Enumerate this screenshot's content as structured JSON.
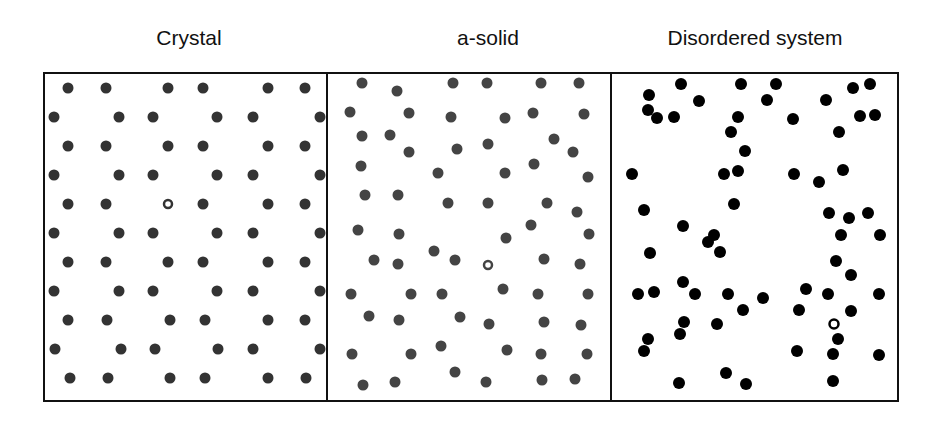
{
  "panels": [
    {
      "id": "crystal",
      "title": "Crystal",
      "title_x": 189,
      "x0": 44,
      "x1": 327,
      "dot_color": "#333333",
      "dot_r": 5.5,
      "open": [
        [
          168,
          204
        ]
      ],
      "dots": [
        [
          68,
          88
        ],
        [
          106,
          88
        ],
        [
          168,
          88
        ],
        [
          203,
          88
        ],
        [
          268,
          88
        ],
        [
          305,
          88
        ],
        [
          54,
          117
        ],
        [
          119,
          117
        ],
        [
          153,
          117
        ],
        [
          217,
          117
        ],
        [
          253,
          117
        ],
        [
          320,
          117
        ],
        [
          68,
          146
        ],
        [
          106,
          146
        ],
        [
          168,
          146
        ],
        [
          203,
          146
        ],
        [
          268,
          146
        ],
        [
          305,
          146
        ],
        [
          54,
          175
        ],
        [
          119,
          175
        ],
        [
          153,
          175
        ],
        [
          217,
          175
        ],
        [
          253,
          175
        ],
        [
          320,
          175
        ],
        [
          68,
          204
        ],
        [
          106,
          204
        ],
        [
          203,
          204
        ],
        [
          268,
          204
        ],
        [
          305,
          204
        ],
        [
          54,
          233
        ],
        [
          119,
          233
        ],
        [
          153,
          233
        ],
        [
          217,
          233
        ],
        [
          253,
          233
        ],
        [
          320,
          233
        ],
        [
          68,
          262
        ],
        [
          106,
          262
        ],
        [
          168,
          262
        ],
        [
          203,
          262
        ],
        [
          268,
          262
        ],
        [
          305,
          262
        ],
        [
          54,
          291
        ],
        [
          119,
          291
        ],
        [
          153,
          291
        ],
        [
          217,
          291
        ],
        [
          253,
          291
        ],
        [
          320,
          291
        ],
        [
          68,
          320
        ],
        [
          107,
          320
        ],
        [
          170,
          320
        ],
        [
          205,
          320
        ],
        [
          268,
          320
        ],
        [
          305,
          320
        ],
        [
          55,
          349
        ],
        [
          121,
          349
        ],
        [
          155,
          349
        ],
        [
          218,
          349
        ],
        [
          253,
          349
        ],
        [
          320,
          349
        ],
        [
          70,
          378
        ],
        [
          108,
          378
        ],
        [
          170,
          378
        ],
        [
          205,
          378
        ],
        [
          268,
          378
        ],
        [
          306,
          378
        ]
      ]
    },
    {
      "id": "a-solid",
      "title": "a-solid",
      "title_x": 488,
      "x0": 327,
      "x1": 611,
      "dot_color": "#444444",
      "dot_r": 5.5,
      "open": [
        [
          488,
          265
        ]
      ],
      "dots": [
        [
          362,
          83
        ],
        [
          397,
          91
        ],
        [
          453,
          83
        ],
        [
          487,
          83
        ],
        [
          541,
          83
        ],
        [
          579,
          83
        ],
        [
          350,
          112
        ],
        [
          409,
          113
        ],
        [
          451,
          117
        ],
        [
          505,
          118
        ],
        [
          533,
          113
        ],
        [
          584,
          114
        ],
        [
          362,
          136
        ],
        [
          390,
          135
        ],
        [
          409,
          152
        ],
        [
          457,
          149
        ],
        [
          488,
          144
        ],
        [
          554,
          139
        ],
        [
          573,
          152
        ],
        [
          361,
          166
        ],
        [
          438,
          173
        ],
        [
          505,
          173
        ],
        [
          534,
          164
        ],
        [
          588,
          177
        ],
        [
          365,
          195
        ],
        [
          398,
          195
        ],
        [
          448,
          203
        ],
        [
          488,
          203
        ],
        [
          547,
          203
        ],
        [
          577,
          212
        ],
        [
          358,
          230
        ],
        [
          399,
          234
        ],
        [
          506,
          238
        ],
        [
          531,
          225
        ],
        [
          589,
          234
        ],
        [
          374,
          260
        ],
        [
          398,
          264
        ],
        [
          434,
          251
        ],
        [
          455,
          260
        ],
        [
          544,
          259
        ],
        [
          580,
          264
        ],
        [
          351,
          294
        ],
        [
          411,
          294
        ],
        [
          442,
          294
        ],
        [
          503,
          289
        ],
        [
          538,
          294
        ],
        [
          588,
          294
        ],
        [
          369,
          316
        ],
        [
          399,
          320
        ],
        [
          460,
          317
        ],
        [
          489,
          324
        ],
        [
          544,
          322
        ],
        [
          581,
          325
        ],
        [
          352,
          354
        ],
        [
          411,
          354
        ],
        [
          441,
          346
        ],
        [
          507,
          350
        ],
        [
          541,
          354
        ],
        [
          587,
          354
        ],
        [
          363,
          385
        ],
        [
          395,
          382
        ],
        [
          455,
          372
        ],
        [
          486,
          382
        ],
        [
          542,
          380
        ],
        [
          575,
          379
        ]
      ]
    },
    {
      "id": "disordered",
      "title": "Disordered system",
      "title_x": 755,
      "x0": 611,
      "x1": 898,
      "dot_color": "#000000",
      "dot_r": 6,
      "open": [
        [
          834,
          324
        ]
      ],
      "dots": [
        [
          681,
          84
        ],
        [
          741,
          84
        ],
        [
          776,
          84
        ],
        [
          853,
          88
        ],
        [
          870,
          84
        ],
        [
          649,
          95
        ],
        [
          699,
          101
        ],
        [
          767,
          100
        ],
        [
          826,
          100
        ],
        [
          648,
          110
        ],
        [
          657,
          118
        ],
        [
          674,
          117
        ],
        [
          738,
          117
        ],
        [
          793,
          119
        ],
        [
          860,
          116
        ],
        [
          875,
          115
        ],
        [
          731,
          132
        ],
        [
          839,
          132
        ],
        [
          745,
          151
        ],
        [
          632,
          174
        ],
        [
          724,
          174
        ],
        [
          738,
          171
        ],
        [
          794,
          174
        ],
        [
          819,
          182
        ],
        [
          843,
          170
        ],
        [
          644,
          210
        ],
        [
          734,
          204
        ],
        [
          829,
          213
        ],
        [
          868,
          213
        ],
        [
          849,
          218
        ],
        [
          683,
          226
        ],
        [
          714,
          235
        ],
        [
          708,
          242
        ],
        [
          720,
          252
        ],
        [
          841,
          235
        ],
        [
          880,
          235
        ],
        [
          650,
          253
        ],
        [
          836,
          261
        ],
        [
          851,
          275
        ],
        [
          683,
          282
        ],
        [
          638,
          294
        ],
        [
          654,
          292
        ],
        [
          695,
          294
        ],
        [
          728,
          294
        ],
        [
          763,
          298
        ],
        [
          806,
          289
        ],
        [
          828,
          294
        ],
        [
          879,
          294
        ],
        [
          743,
          310
        ],
        [
          799,
          310
        ],
        [
          851,
          311
        ],
        [
          684,
          322
        ],
        [
          717,
          324
        ],
        [
          648,
          339
        ],
        [
          680,
          334
        ],
        [
          838,
          339
        ],
        [
          644,
          351
        ],
        [
          797,
          351
        ],
        [
          833,
          354
        ],
        [
          879,
          355
        ],
        [
          726,
          373
        ],
        [
          679,
          383
        ],
        [
          746,
          384
        ],
        [
          833,
          381
        ]
      ]
    }
  ],
  "box": {
    "top": 73,
    "bottom": 401,
    "left": 44,
    "right": 898,
    "stroke": "#111111",
    "stroke_width": 2
  }
}
